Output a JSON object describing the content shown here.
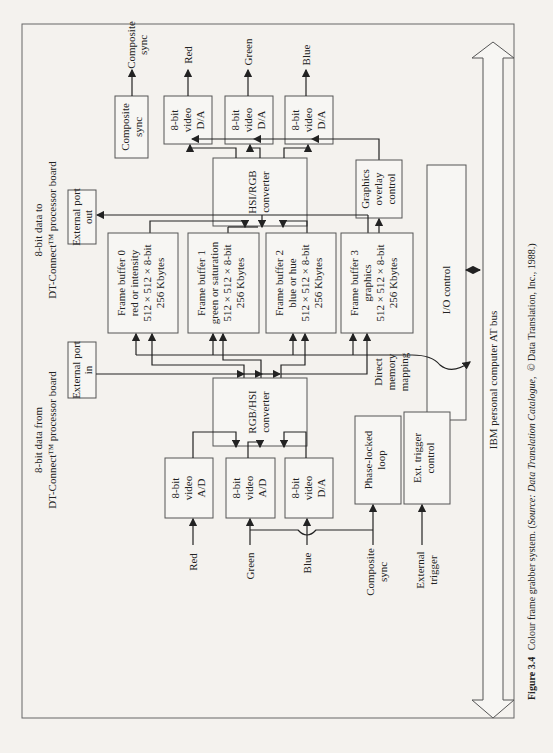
{
  "figure": {
    "caption_label": "Figure 3.4",
    "caption_text": "Colour frame grabber system. (",
    "caption_source_label": "Source: Data Translation Catalogue,",
    "caption_tail": "© Data Translation, Inc., 1988.)"
  },
  "top_labels": {
    "data_to_line1": "8-bit data to",
    "data_to_line2": "DT-Connect™ processor board",
    "data_from_line1": "8-bit data from",
    "data_from_line2": "DT-Connect™ processor board"
  },
  "outputs": {
    "composite_sync_box": [
      "Composite",
      "sync"
    ],
    "composite_sync_label": [
      "Composite",
      "sync"
    ],
    "red_da": [
      "8-bit",
      "video",
      "D/A"
    ],
    "green_da": [
      "8-bit",
      "video",
      "D/A"
    ],
    "blue_da": [
      "8-bit",
      "video",
      "D/A"
    ],
    "red_label": "Red",
    "green_label": "Green",
    "blue_label": "Blue"
  },
  "hsi_rgb": [
    "HSI/RGB",
    "converter"
  ],
  "graphics_overlay": [
    "Graphics",
    "overlay",
    "control"
  ],
  "external_port_out": [
    "External port",
    "out"
  ],
  "external_port_in": [
    "External port",
    "in"
  ],
  "frame_buffers": [
    [
      "Frame buffer 0",
      "red or intensity",
      "512 × 512 × 8-bit",
      "256 Kbytes"
    ],
    [
      "Frame buffer 1",
      "green or saturation",
      "512 × 512 × 8-bit",
      "256 Kbytes"
    ],
    [
      "Frame buffer 2",
      "blue or hue",
      "512 × 512 × 8-bit",
      "256 Kbytes"
    ],
    [
      "Frame buffer 3",
      "graphics",
      "512 × 512 × 8-bit",
      "256 Kbytes"
    ]
  ],
  "io_control": "I/O control",
  "dma_label": [
    "Direct",
    "memory",
    "mapping"
  ],
  "rgb_hsi": [
    "RGB/HSI",
    "converter"
  ],
  "inputs": {
    "red_ad": [
      "8-bit",
      "video",
      "A/D"
    ],
    "green_ad": [
      "8-bit",
      "video",
      "A/D"
    ],
    "blue_da": [
      "8-bit",
      "video",
      "D/A"
    ],
    "pll": [
      "Phase-locked",
      "loop"
    ],
    "ext_trigger": [
      "Ext. trigger",
      "control"
    ],
    "red_label": "Red",
    "green_label": "Green",
    "blue_label": "Blue",
    "composite_label": [
      "Composite",
      "sync"
    ],
    "external_trigger_label": [
      "External",
      "trigger"
    ]
  },
  "bus_label": "IBM personal computer AT bus",
  "colors": {
    "background": "#f4f2ee",
    "ink": "#222222",
    "box_stroke": "#555555"
  }
}
